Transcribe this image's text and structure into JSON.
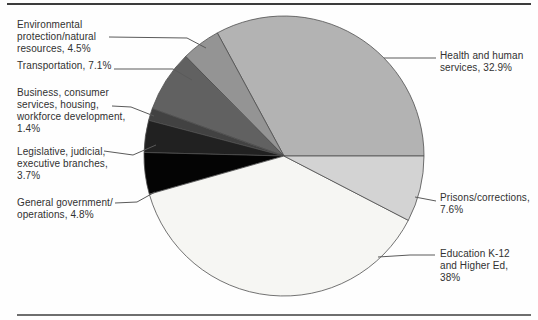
{
  "figure": {
    "background": "#fefefe",
    "rule_color_top": "#3c3c3c",
    "rule_color_bottom": "#6e6e6e",
    "text_color": "#313131",
    "slice_stroke_color": "#4f4f4f"
  },
  "chart_data": {
    "type": "pie",
    "title": "",
    "start_angle_deg": 0,
    "direction": "counterclockwise",
    "legend_position": "none",
    "labels_use_leader_lines": true,
    "slices": [
      {
        "id": "health",
        "label": "Health and human services",
        "value": 32.9,
        "color": "#b3b3b3"
      },
      {
        "id": "environmental",
        "label": "Environmental protection/natural resources",
        "value": 4.5,
        "color": "#949494"
      },
      {
        "id": "transportation",
        "label": "Transportation",
        "value": 7.1,
        "color": "#616161"
      },
      {
        "id": "business",
        "label": "Business, consumer services, housing, workforce development",
        "value": 1.4,
        "color": "#424242"
      },
      {
        "id": "legislative",
        "label": "Legislative, judicial, executive branches",
        "value": 3.7,
        "color": "#212121"
      },
      {
        "id": "general",
        "label": "General government/operations",
        "value": 4.8,
        "color": "#040404"
      },
      {
        "id": "education",
        "label": "Education K-12 and Higher Ed",
        "value": 38,
        "color": "#f6f6f3"
      },
      {
        "id": "prisons",
        "label": "Prisons/corrections",
        "value": 7.6,
        "color": "#d3d3d3"
      }
    ]
  },
  "labels": {
    "environmental": "Environmental\nprotection/natural\nresources, 4.5%",
    "transportation": "Transportation, 7.1%",
    "business": "Business, consumer\nservices, housing,\nworkforce development,\n1.4%",
    "legislative": "Legislative, judicial,\nexecutive branches,\n3.7%",
    "general": "General government/\noperations, 4.8%",
    "health": "Health and human\nservices, 32.9%",
    "prisons": "Prisons/corrections,\n7.6%",
    "education": "Education K-12\nand Higher Ed,\n38%"
  }
}
